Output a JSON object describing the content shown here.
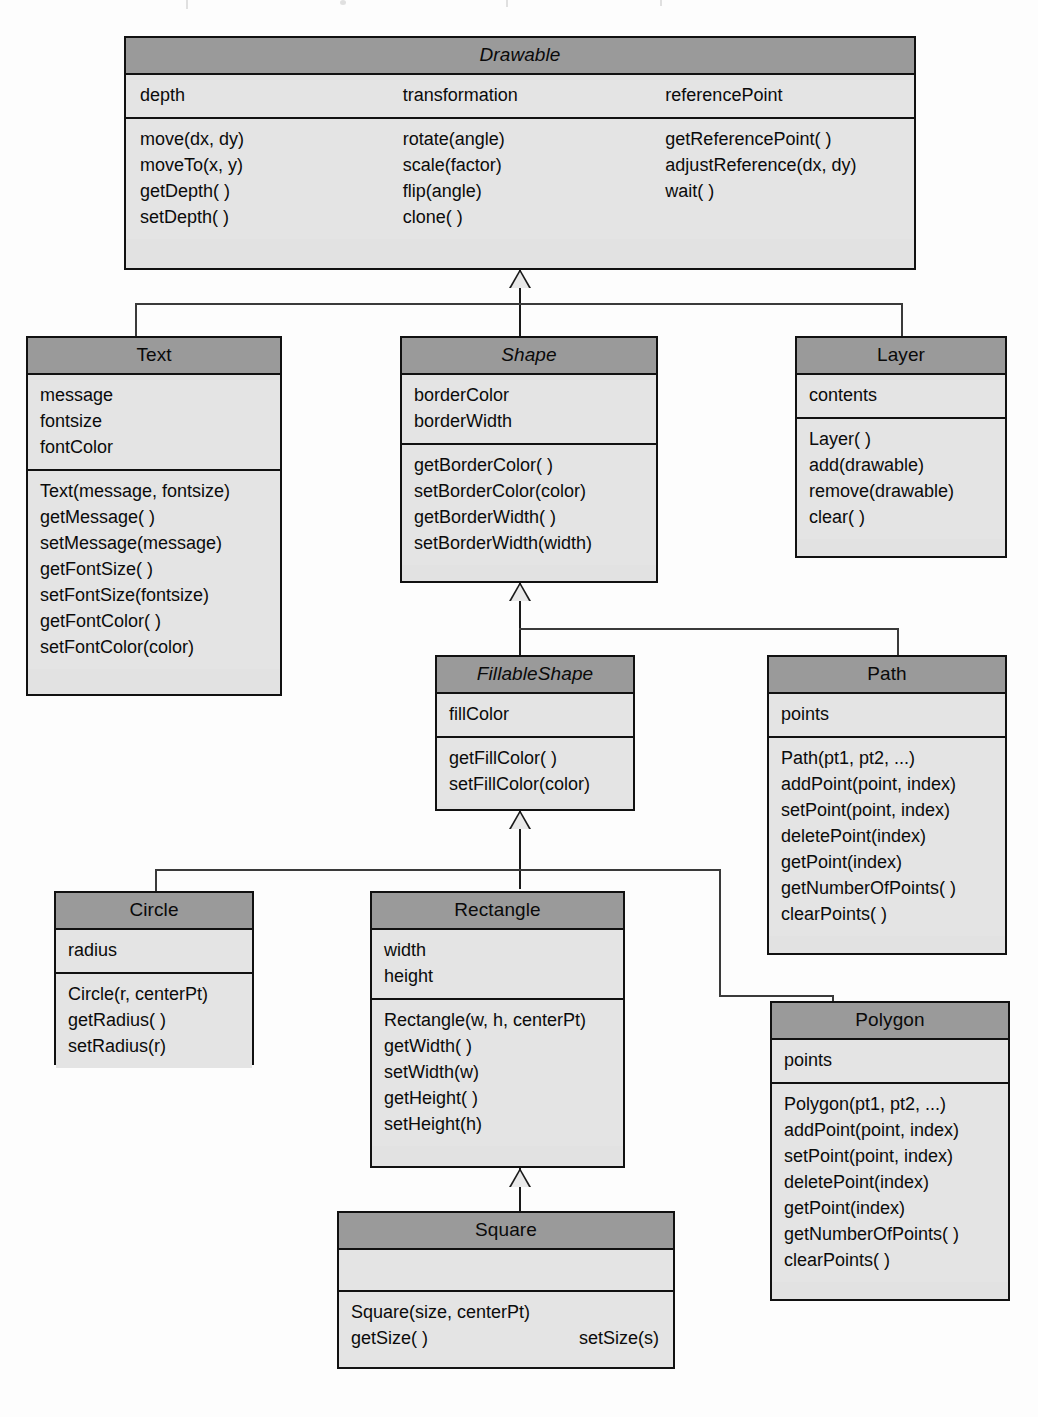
{
  "diagram": {
    "type": "uml-class-diagram",
    "colors": {
      "header_fill": "#9a9a9a",
      "body_fill": "#e4e4e4",
      "border": "#111111",
      "page_background": "#fdfdfd"
    },
    "classes": [
      {
        "id": "drawable",
        "name": "Drawable",
        "abstract": true,
        "attribute_columns": [
          [
            "depth"
          ],
          [
            "transformation"
          ],
          [
            "referencePoint"
          ]
        ],
        "method_columns": [
          [
            "move(dx, dy)",
            "moveTo(x, y)",
            "getDepth( )",
            "setDepth( )"
          ],
          [
            "rotate(angle)",
            "scale(factor)",
            "flip(angle)",
            "clone( )"
          ],
          [
            "getReferencePoint( )",
            "adjustReference(dx, dy)",
            "wait( )"
          ]
        ]
      },
      {
        "id": "text",
        "name": "Text",
        "abstract": false,
        "attributes": [
          "message",
          "fontsize",
          "fontColor"
        ],
        "methods": [
          "Text(message, fontsize)",
          "getMessage( )",
          "setMessage(message)",
          "getFontSize( )",
          "setFontSize(fontsize)",
          "getFontColor( )",
          "setFontColor(color)"
        ]
      },
      {
        "id": "shape",
        "name": "Shape",
        "abstract": true,
        "attributes": [
          "borderColor",
          "borderWidth"
        ],
        "methods": [
          "getBorderColor( )",
          "setBorderColor(color)",
          "getBorderWidth( )",
          "setBorderWidth(width)"
        ]
      },
      {
        "id": "layer",
        "name": "Layer",
        "abstract": false,
        "attributes": [
          "contents"
        ],
        "methods": [
          "Layer( )",
          "add(drawable)",
          "remove(drawable)",
          "clear( )"
        ]
      },
      {
        "id": "fillableshape",
        "name": "FillableShape",
        "abstract": true,
        "attributes": [
          "fillColor"
        ],
        "methods": [
          "getFillColor( )",
          "setFillColor(color)"
        ]
      },
      {
        "id": "path",
        "name": "Path",
        "abstract": false,
        "attributes": [
          "points"
        ],
        "methods": [
          "Path(pt1, pt2, ...)",
          "addPoint(point, index)",
          "setPoint(point, index)",
          "deletePoint(index)",
          "getPoint(index)",
          "getNumberOfPoints( )",
          "clearPoints( )"
        ]
      },
      {
        "id": "circle",
        "name": "Circle",
        "abstract": false,
        "attributes": [
          "radius"
        ],
        "methods": [
          "Circle(r, centerPt)",
          "getRadius( )",
          "setRadius(r)"
        ]
      },
      {
        "id": "rectangle",
        "name": "Rectangle",
        "abstract": false,
        "attributes": [
          "width",
          "height"
        ],
        "methods": [
          "Rectangle(w, h, centerPt)",
          "getWidth( )",
          "setWidth(w)",
          "getHeight( )",
          "setHeight(h)"
        ]
      },
      {
        "id": "polygon",
        "name": "Polygon",
        "abstract": false,
        "attributes": [
          "points"
        ],
        "methods": [
          "Polygon(pt1, pt2, ...)",
          "addPoint(point, index)",
          "setPoint(point, index)",
          "deletePoint(index)",
          "getPoint(index)",
          "getNumberOfPoints( )",
          "clearPoints( )"
        ]
      },
      {
        "id": "square",
        "name": "Square",
        "abstract": false,
        "attributes": [],
        "methods": [
          "Square(size, centerPt)",
          "getSize( )"
        ],
        "methods_right": [
          "setSize(s)"
        ]
      }
    ],
    "generalizations": [
      {
        "parent": "Drawable",
        "children": [
          "Text",
          "Shape",
          "Layer"
        ]
      },
      {
        "parent": "Shape",
        "children": [
          "FillableShape",
          "Path"
        ]
      },
      {
        "parent": "FillableShape",
        "children": [
          "Circle",
          "Rectangle",
          "Polygon"
        ]
      },
      {
        "parent": "Rectangle",
        "children": [
          "Square"
        ]
      }
    ]
  }
}
